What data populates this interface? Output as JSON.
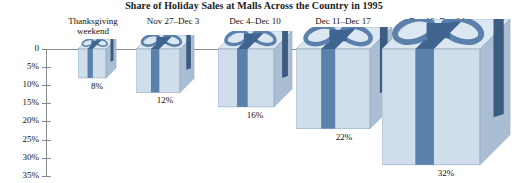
{
  "chart_data": {
    "type": "bar",
    "title": "Share of Holiday Sales at Malls Across the Country in 1995",
    "xlabel": "",
    "ylabel": "",
    "ylim": [
      0,
      35
    ],
    "grid": false,
    "legend": null,
    "categories": [
      "Thanksgiving\nweekend",
      "Nov 27–Dec 3",
      "Dec 4–Dec 10",
      "Dec 11–Dec 17",
      "Dec 18–Dec 24"
    ],
    "values": [
      8,
      12,
      16,
      22,
      32
    ],
    "data_labels": [
      "8%",
      "12%",
      "16%",
      "22%",
      "32%"
    ],
    "ytick_labels": [
      "0",
      "5%",
      "10%",
      "15%",
      "20%",
      "25%",
      "30%",
      "35%"
    ],
    "ytick_values": [
      0,
      5,
      10,
      15,
      20,
      25,
      30,
      35
    ],
    "note": "Bars drawn as 3D gift boxes with ribbon and bow; height proportional to percent share."
  },
  "colors": {
    "box_front": "#cfdeea",
    "box_front_shade": "#bcd0e2",
    "box_top": "#dce8f1",
    "box_side": "#a9bed2",
    "ribbon": "#5b80ab",
    "ribbon_dark": "#3f6490",
    "ribbon_side": "#36557c",
    "outline": "#8fa8bf",
    "axis": "#8a8a8a",
    "text": "#111111"
  },
  "boxes": [
    {
      "label": "8%",
      "percent": 8,
      "name": "gift-box-thanksgiving-weekend"
    },
    {
      "label": "12%",
      "percent": 12,
      "name": "gift-box-nov27-dec3"
    },
    {
      "label": "16%",
      "percent": 16,
      "name": "gift-box-dec4-dec10"
    },
    {
      "label": "22%",
      "percent": 22,
      "name": "gift-box-dec11-dec17"
    },
    {
      "label": "32%",
      "percent": 32,
      "name": "gift-box-dec18-dec24"
    }
  ]
}
